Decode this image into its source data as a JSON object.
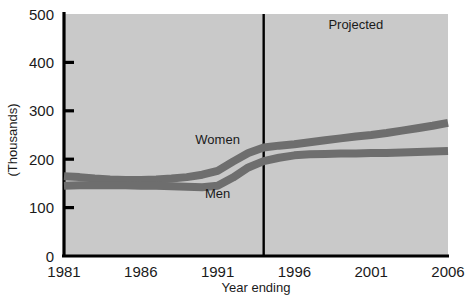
{
  "chart_data": {
    "type": "line",
    "title": "",
    "xlabel": "Year ending",
    "ylabel": "(Thousands)",
    "x": [
      1981,
      1982,
      1983,
      1984,
      1985,
      1986,
      1987,
      1988,
      1989,
      1990,
      1991,
      1992,
      1993,
      1994,
      1995,
      1996,
      1997,
      1998,
      1999,
      2000,
      2001,
      2002,
      2003,
      2004,
      2005,
      2006
    ],
    "xlim": [
      1981,
      2006
    ],
    "ylim": [
      0,
      500
    ],
    "xticks": [
      "1981",
      "1986",
      "1991",
      "1996",
      "2001",
      "2006"
    ],
    "xtick_values": [
      1981,
      1986,
      1991,
      1996,
      2001,
      2006
    ],
    "yticks": [
      "0",
      "100",
      "200",
      "300",
      "400",
      "500"
    ],
    "ytick_values": [
      0,
      100,
      200,
      300,
      400,
      500
    ],
    "grid": false,
    "legend_position": "inline-labels",
    "plot_background": "#c9c9c9",
    "series": [
      {
        "name": "Women",
        "color": "#6e6e6e",
        "label_x": 1991,
        "label_y": 232,
        "values": [
          165,
          163,
          160,
          158,
          157,
          157,
          158,
          160,
          163,
          168,
          176,
          195,
          213,
          224,
          228,
          231,
          235,
          239,
          243,
          247,
          250,
          254,
          259,
          264,
          269,
          275
        ]
      },
      {
        "name": "Men",
        "color": "#6e6e6e",
        "label_x": 1991,
        "label_y": 120,
        "values": [
          145,
          146,
          146,
          146,
          146,
          145,
          145,
          144,
          143,
          142,
          145,
          162,
          183,
          196,
          203,
          208,
          210,
          211,
          212,
          212,
          213,
          213,
          214,
          215,
          216,
          217
        ]
      }
    ],
    "annotations": [
      {
        "name": "projected-label",
        "text": "Projected",
        "x": 2000,
        "y": 470
      },
      {
        "name": "projection-divider",
        "type": "vline",
        "x": 1994,
        "color": "#000000"
      }
    ]
  },
  "axes": {
    "y_title": "(Thousands)",
    "x_title": "Year ending",
    "y_tick_labels": [
      "500",
      "400",
      "300",
      "200",
      "100",
      "0"
    ],
    "x_tick_labels": [
      "1981",
      "1986",
      "1991",
      "1996",
      "2001",
      "2006"
    ]
  },
  "labels": {
    "women": "Women",
    "men": "Men",
    "projected": "Projected"
  },
  "colors": {
    "plot_bg": "#c9c9c9",
    "line": "#6e6e6e",
    "axis": "#000000",
    "text": "#1a1a1a",
    "page_bg": "#ffffff"
  }
}
